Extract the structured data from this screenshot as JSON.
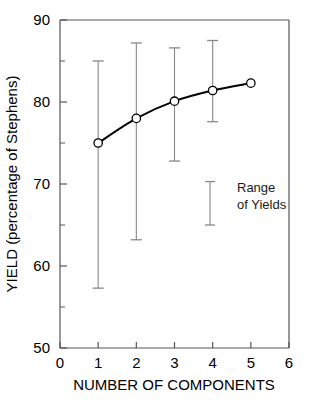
{
  "chart_data": {
    "type": "line",
    "title": "",
    "xlabel": "NUMBER OF COMPONENTS",
    "ylabel": "YIELD (percentage of Stephens)",
    "xlim": [
      0,
      6
    ],
    "ylim": [
      50,
      90
    ],
    "xticks": [
      0,
      1,
      2,
      3,
      4,
      5,
      6
    ],
    "xtick_labels": [
      "0",
      "1",
      "2",
      "3",
      "4",
      "5",
      "6"
    ],
    "yticks": [
      50,
      60,
      70,
      80,
      90
    ],
    "ytick_labels": [
      "50",
      "60",
      "70",
      "80",
      "90"
    ],
    "yminorticks": [
      55,
      65,
      75,
      85
    ],
    "grid": false,
    "legend_position": "inside-right",
    "x": [
      1,
      2,
      3,
      4,
      5
    ],
    "values": [
      75.0,
      78.0,
      80.1,
      81.4,
      82.3
    ],
    "errorbar_low": [
      57.3,
      63.2,
      72.8,
      77.6,
      null
    ],
    "errorbar_high": [
      85.0,
      87.2,
      86.6,
      87.5,
      null
    ],
    "series": [
      {
        "name": "Yield",
        "marker": "open-circle",
        "line_color": "#000000",
        "values": [
          75.0,
          78.0,
          80.1,
          81.4,
          82.3
        ]
      }
    ],
    "annotations": [
      {
        "name": "range-of-yields-legend",
        "line1": "Range",
        "line2": "of Yields",
        "sample_bar_low": 65.0,
        "sample_bar_high": 70.3,
        "x_position": 3.93
      }
    ],
    "colors": {
      "line": "#000000",
      "marker_fill": "#ffffff",
      "marker_stroke": "#000000",
      "errorbar": "#888888",
      "axis": "#555555",
      "text": "#000000"
    }
  },
  "axis": {
    "x_title": "NUMBER OF COMPONENTS",
    "y_title": "YIELD (percentage of Stephens)"
  },
  "legend": {
    "line1": "Range",
    "line2": "of Yields"
  },
  "ticks": {
    "x": [
      "0",
      "1",
      "2",
      "3",
      "4",
      "5",
      "6"
    ],
    "y": [
      "50",
      "60",
      "70",
      "80",
      "90"
    ]
  }
}
